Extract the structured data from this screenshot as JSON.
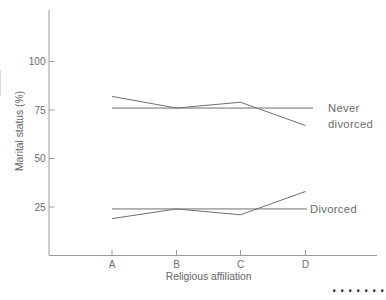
{
  "chart_data": {
    "type": "line",
    "title": "",
    "xlabel": "Religious affiliation",
    "ylabel": "Marital status (%)",
    "categories": [
      "A",
      "B",
      "C",
      "D"
    ],
    "yticks": [
      100,
      75,
      50,
      25
    ],
    "ylim": [
      0,
      127
    ],
    "grid": false,
    "legend_position": "right-of-line-end",
    "series": [
      {
        "name": "Never divorced",
        "label_lines": [
          "Never",
          "divorced"
        ],
        "values": [
          82,
          76,
          79,
          67
        ],
        "reference_line": 76
      },
      {
        "name": "Divorced",
        "label_lines": [
          "Divorced"
        ],
        "values": [
          19,
          24,
          21,
          33
        ],
        "reference_line": 24
      }
    ],
    "colors": {
      "data_line": "#6f6f6f",
      "axis": "#9b9b9b",
      "tick_text": "#6b6b6b",
      "axis_title_text": "#666666",
      "series_label_text": "#6b6b6b",
      "page_dots": "#2f2f2f"
    }
  },
  "footer_dots": {
    "count": 7
  }
}
